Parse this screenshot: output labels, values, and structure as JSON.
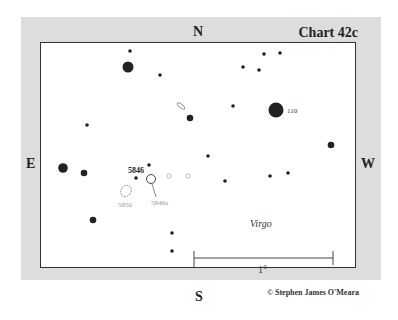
{
  "chart": {
    "title": "Chart 42c",
    "directions": {
      "north": "N",
      "south": "S",
      "east": "E",
      "west": "W"
    },
    "constellation": "Virgo",
    "scale_label": "1°",
    "copyright": "© Stephen James O'Meara",
    "labels": {
      "ngc5846": "5846",
      "ngc5850": "5850",
      "ngc5846a": "5846a",
      "star110": "110"
    }
  },
  "colors": {
    "background": "#dddddd",
    "plot": "#ffffff",
    "ink": "#222222",
    "faint": "#999999"
  }
}
